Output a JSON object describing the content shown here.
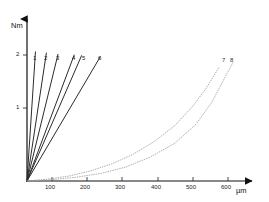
{
  "chart_data": {
    "type": "line",
    "title": "",
    "xlabel": "µm",
    "ylabel": "Nm",
    "xlim": [
      0,
      660
    ],
    "ylim": [
      0,
      2.75
    ],
    "grid": false,
    "legend": "inline-end-labels",
    "x_ticks": [
      {
        "value": 100,
        "label": "100"
      },
      {
        "value": 200,
        "label": "200"
      },
      {
        "value": 300,
        "label": "300"
      },
      {
        "value": 400,
        "label": "400"
      },
      {
        "value": 500,
        "label": "500"
      },
      {
        "value": 600,
        "label": "600"
      }
    ],
    "y_ticks": [
      {
        "value": 1,
        "label": "1"
      },
      {
        "value": 2,
        "label": "2"
      }
    ],
    "series": [
      {
        "name": "1",
        "label": "1",
        "style": "solid",
        "color": "#2b2b2b",
        "points": [
          [
            0,
            0
          ],
          [
            24,
            2.05
          ]
        ]
      },
      {
        "name": "2",
        "label": "2",
        "style": "solid",
        "color": "#2b2b2b",
        "points": [
          [
            0,
            0
          ],
          [
            55,
            2.03
          ]
        ]
      },
      {
        "name": "3",
        "label": "3",
        "style": "solid",
        "color": "#2b2b2b",
        "points": [
          [
            0,
            0
          ],
          [
            88,
            2.01
          ]
        ]
      },
      {
        "name": "4",
        "label": "4",
        "style": "solid",
        "color": "#2b2b2b",
        "points": [
          [
            0,
            0
          ],
          [
            134,
            2.0
          ]
        ]
      },
      {
        "name": "5",
        "label": "5",
        "style": "solid",
        "color": "#2b2b2b",
        "points": [
          [
            0,
            0
          ],
          [
            155,
            1.99
          ]
        ]
      },
      {
        "name": "6",
        "label": "6",
        "style": "solid",
        "color": "#2b2b2b",
        "points": [
          [
            0,
            0
          ],
          [
            208,
            1.97
          ]
        ]
      },
      {
        "name": "7",
        "label": "7",
        "style": "dotted",
        "color": "#9a9a9a",
        "points": [
          [
            0,
            0
          ],
          [
            60,
            0.03
          ],
          [
            120,
            0.08
          ],
          [
            180,
            0.16
          ],
          [
            240,
            0.27
          ],
          [
            300,
            0.42
          ],
          [
            360,
            0.62
          ],
          [
            420,
            0.88
          ],
          [
            470,
            1.18
          ],
          [
            510,
            1.48
          ],
          [
            545,
            1.8
          ]
        ]
      },
      {
        "name": "8",
        "label": "8",
        "style": "dotted",
        "color": "#9a9a9a",
        "points": [
          [
            0,
            0
          ],
          [
            70,
            0.02
          ],
          [
            140,
            0.06
          ],
          [
            210,
            0.12
          ],
          [
            280,
            0.22
          ],
          [
            350,
            0.38
          ],
          [
            420,
            0.6
          ],
          [
            480,
            0.9
          ],
          [
            525,
            1.25
          ],
          [
            560,
            1.62
          ],
          [
            585,
            1.88
          ]
        ]
      }
    ],
    "series_labels_top": [
      "1",
      "2",
      "3",
      "4",
      "5",
      "6"
    ],
    "dotted_labels_top": [
      "7",
      "8"
    ]
  },
  "axes": {
    "y_axis_name": "Nm",
    "x_axis_name": "µm"
  }
}
